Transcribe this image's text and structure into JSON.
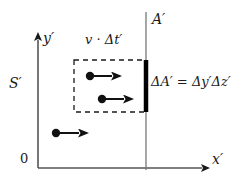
{
  "figure": {
    "background_color": "#ffffff",
    "ink_color": "#1a1a1a",
    "width": 252,
    "height": 183
  },
  "labels": {
    "y_axis": "y′",
    "x_axis": "x′",
    "origin": "0",
    "frame": "S′",
    "plane": "A′",
    "length": "v · Δt′",
    "area_equation": "ΔA′ = Δy′Δz′"
  },
  "area_equation_parts": {
    "lhs": "ΔA′",
    "equals": "=",
    "rhs": "Δy′Δz′"
  },
  "geometry": {
    "y_axis": {
      "x": 38,
      "y_top": 36,
      "y_bottom": 168
    },
    "x_axis": {
      "y": 168,
      "x_left": 38,
      "x_right": 208
    },
    "plane_line": {
      "x": 146,
      "y_top": 12,
      "y_bottom": 170
    },
    "area_bar": {
      "x": 146,
      "y_top": 60,
      "y_bottom": 112,
      "thickness": 4
    },
    "dashed_box": {
      "x": 74,
      "y": 60,
      "width": 72,
      "height": 52
    }
  },
  "particles": [
    {
      "name": "particle-1",
      "dot_x": 90,
      "dot_y": 76,
      "arrow_tip_x": 120
    },
    {
      "name": "particle-2",
      "dot_x": 102,
      "dot_y": 99,
      "arrow_tip_x": 132
    },
    {
      "name": "particle-3",
      "dot_x": 56,
      "dot_y": 133,
      "arrow_tip_x": 88
    }
  ]
}
